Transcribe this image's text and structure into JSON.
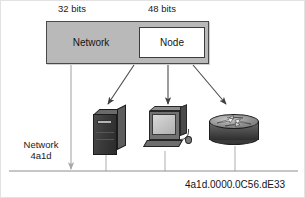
{
  "figure": {
    "background_color": "#ffffff",
    "border_color": "#e2e2e2"
  },
  "captions": {
    "network_bits": "32 bits",
    "node_bits": "48 bits"
  },
  "address_bar": {
    "network_field_label": "Network",
    "node_field_label": "Node",
    "fill_color": "#b9b9b9",
    "node_fill_color": "#ffffff",
    "border_color": "#4a4a4a"
  },
  "labels": {
    "network_name_line1": "Network",
    "network_name_line2": "4a1d",
    "full_address": "4a1d.0000.0C56.dE33"
  },
  "devices": [
    {
      "id": "server",
      "icon": "server-tower-icon",
      "label": ""
    },
    {
      "id": "workstation",
      "icon": "desktop-computer-icon",
      "label": ""
    },
    {
      "id": "router",
      "icon": "router-icon",
      "label": ""
    }
  ],
  "connectors": {
    "network_pointer": "arrow-down",
    "node_pointers": [
      "arrow-to-server",
      "arrow-to-workstation",
      "arrow-to-router"
    ],
    "bus_line": "network-segment-line",
    "line_color": "#8e8e8e",
    "arrow_color": "#3a3a3a"
  }
}
